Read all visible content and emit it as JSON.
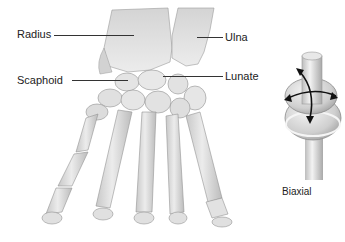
{
  "figure": {
    "labels": {
      "radius": "Radius",
      "ulna": "Ulna",
      "scaphoid": "Scaphoid",
      "lunate": "Lunate",
      "biaxial": "Biaxial"
    },
    "icons": {
      "hand_skeleton": "hand-bones-illustration",
      "joint_model": "condyloid-joint-model",
      "motion_arrows": "biaxial-motion-arrows"
    },
    "colors": {
      "bone_fill": "#e6e6e6",
      "bone_shade": "#bdbdbd",
      "bone_outline": "#8a8a8a",
      "leader_line": "#333333",
      "text": "#222222",
      "arrow": "#111111",
      "background": "#ffffff"
    }
  }
}
